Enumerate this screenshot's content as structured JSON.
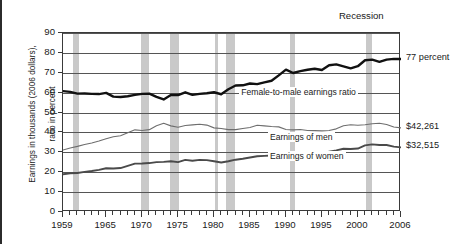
{
  "figure": {
    "recession_label": "Recession",
    "ylabel_line1": "Earnings in thousands (2006 dollars),",
    "ylabel_line2": "ratio in percent"
  },
  "callouts": {
    "ratio": "77 percent",
    "men": "$42,261",
    "women": "$32,515"
  },
  "series_labels": {
    "ratio": "Female-to-male earnings ratio",
    "men": "Earnings of men",
    "women": "Earnings of women"
  },
  "colors": {
    "ratio_line": "#111111",
    "men_line": "#6e6e6e",
    "women_line": "#4a4a4a",
    "recession_band": "#c9c9c9",
    "grid": "#555555",
    "axis": "#3a3a3a"
  },
  "chart_data": {
    "type": "line",
    "title": "",
    "xlabel": "",
    "ylabel": "Earnings in thousands (2006 dollars), ratio in percent",
    "xlim": [
      1959,
      2006
    ],
    "ylim": [
      0,
      90
    ],
    "yticks": [
      0,
      10,
      20,
      30,
      40,
      50,
      60,
      70,
      80,
      90
    ],
    "xticks": [
      1959,
      1965,
      1970,
      1975,
      1980,
      1985,
      1990,
      1995,
      2000,
      2006
    ],
    "xtick_labels": [
      "1959",
      "1965",
      "1970",
      "1975",
      "1980",
      "1985",
      "1990",
      "1995",
      "2000",
      "2006"
    ],
    "grid": true,
    "legend": "inline-annotations",
    "x": [
      1959,
      1960,
      1961,
      1962,
      1963,
      1964,
      1965,
      1966,
      1967,
      1968,
      1969,
      1970,
      1971,
      1972,
      1973,
      1974,
      1975,
      1976,
      1977,
      1978,
      1979,
      1980,
      1981,
      1982,
      1983,
      1984,
      1985,
      1986,
      1987,
      1988,
      1989,
      1990,
      1991,
      1992,
      1993,
      1994,
      1995,
      1996,
      1997,
      1998,
      1999,
      2000,
      2001,
      2002,
      2003,
      2004,
      2005,
      2006
    ],
    "series": [
      {
        "name": "Female-to-male earnings ratio",
        "unit": "percent",
        "style": "thick-black",
        "values": [
          60.8,
          60.4,
          59.5,
          59.6,
          59.4,
          59.3,
          59.9,
          58.0,
          57.8,
          58.2,
          58.9,
          59.4,
          59.5,
          57.9,
          56.6,
          58.8,
          58.8,
          60.2,
          58.9,
          59.4,
          59.7,
          60.2,
          59.2,
          61.7,
          63.6,
          63.7,
          64.6,
          64.3,
          65.2,
          66.0,
          68.7,
          71.6,
          69.9,
          70.8,
          71.5,
          72.0,
          71.4,
          73.8,
          74.2,
          73.2,
          72.2,
          73.3,
          76.3,
          76.6,
          75.5,
          76.6,
          77.0,
          76.9
        ]
      },
      {
        "name": "Earnings of men",
        "unit": "thousands of 2006 dollars",
        "style": "thin-gray",
        "values": [
          31.2,
          32.2,
          33.0,
          33.9,
          34.7,
          35.7,
          36.8,
          37.8,
          38.3,
          39.8,
          41.3,
          41.0,
          41.4,
          43.4,
          44.6,
          43.3,
          42.6,
          43.5,
          43.8,
          44.1,
          43.7,
          42.3,
          42.0,
          41.4,
          41.4,
          42.0,
          42.5,
          43.6,
          43.3,
          43.0,
          42.8,
          41.5,
          41.3,
          41.5,
          41.0,
          40.9,
          40.8,
          41.0,
          41.8,
          43.4,
          43.9,
          43.6,
          43.9,
          44.4,
          44.6,
          44.0,
          42.7,
          42.3
        ]
      },
      {
        "name": "Earnings of women",
        "unit": "thousands of 2006 dollars",
        "style": "medium-gray",
        "values": [
          19.0,
          19.4,
          19.6,
          20.2,
          20.6,
          21.2,
          22.0,
          21.9,
          22.1,
          23.2,
          24.3,
          24.4,
          24.6,
          25.1,
          25.2,
          25.5,
          25.1,
          26.2,
          25.8,
          26.2,
          26.1,
          25.5,
          24.9,
          25.5,
          26.3,
          26.8,
          27.4,
          28.0,
          28.2,
          28.4,
          29.4,
          29.7,
          28.9,
          29.4,
          29.3,
          29.5,
          29.1,
          30.3,
          31.0,
          31.8,
          31.7,
          31.9,
          33.5,
          34.0,
          33.7,
          33.7,
          32.9,
          32.5
        ]
      }
    ],
    "recession_bands": [
      {
        "start": 1960.4,
        "end": 1961.2
      },
      {
        "start": 1969.9,
        "end": 1970.9
      },
      {
        "start": 1973.9,
        "end": 1975.2
      },
      {
        "start": 1980.1,
        "end": 1980.6
      },
      {
        "start": 1981.6,
        "end": 1982.9
      },
      {
        "start": 1990.6,
        "end": 1991.2
      },
      {
        "start": 2001.2,
        "end": 2001.9
      }
    ],
    "annotations": [
      {
        "text": "77 percent",
        "series": "Female-to-male earnings ratio",
        "x": 2006,
        "y": 77
      },
      {
        "text": "$42,261",
        "series": "Earnings of men",
        "x": 2006,
        "y": 42.261
      },
      {
        "text": "$32,515",
        "series": "Earnings of women",
        "x": 2006,
        "y": 32.515
      },
      {
        "text": "Recession",
        "x": 2001,
        "y": 95
      }
    ]
  }
}
